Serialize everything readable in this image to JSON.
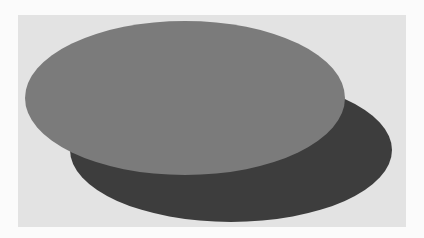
{
  "scene": {
    "width": 424,
    "height": 238,
    "page_background": "#fbfbfb",
    "panel": {
      "x": 18,
      "y": 15,
      "width": 388,
      "height": 212,
      "color": "#e3e3e3"
    },
    "shapes": [
      {
        "name": "dark-ellipse",
        "type": "ellipse",
        "cx": 231,
        "cy": 150,
        "rx": 161,
        "ry": 72,
        "color": "#3d3d3d",
        "layer": "back"
      },
      {
        "name": "light-ellipse",
        "type": "ellipse",
        "cx": 185,
        "cy": 98,
        "rx": 160,
        "ry": 77,
        "color": "#7b7b7b",
        "layer": "front"
      }
    ]
  }
}
